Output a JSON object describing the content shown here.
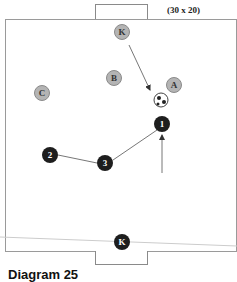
{
  "diagram": {
    "field_size_label": "(30 x 20)",
    "caption": "Diagram 25",
    "defenders": [
      {
        "label": "K",
        "role": "goalkeeper-top"
      },
      {
        "label": "B"
      },
      {
        "label": "A"
      },
      {
        "label": "C"
      }
    ],
    "attackers": [
      {
        "label": "1"
      },
      {
        "label": "2"
      },
      {
        "label": "3"
      },
      {
        "label": "K",
        "role": "goalkeeper-bottom"
      }
    ],
    "colors": {
      "defender_fill": "#b4b4b4",
      "attacker_fill": "#1e1e1e",
      "line": "#777777"
    }
  }
}
